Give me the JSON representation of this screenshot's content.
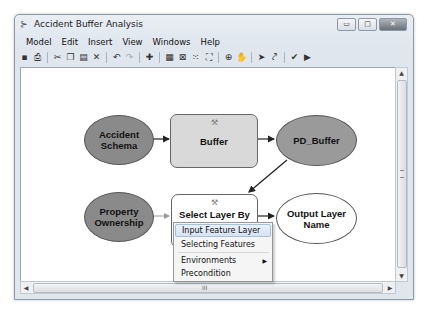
{
  "window": {
    "title": "Accident Buffer Analysis",
    "controls": {
      "minimize": "▭",
      "maximize": "□",
      "close": "✕"
    }
  },
  "menubar": {
    "items": [
      "Model",
      "Edit",
      "Insert",
      "View",
      "Windows",
      "Help"
    ]
  },
  "toolbar": {
    "buttons": [
      {
        "name": "save-icon",
        "glyph": "▪"
      },
      {
        "name": "print-icon",
        "glyph": "⎙"
      },
      {
        "name": "cut-icon",
        "glyph": "✂"
      },
      {
        "name": "copy-icon",
        "glyph": "❐"
      },
      {
        "name": "paste-icon",
        "glyph": "▤"
      },
      {
        "name": "delete-icon",
        "glyph": "✕"
      },
      {
        "name": "undo-icon",
        "glyph": "↶"
      },
      {
        "name": "redo-icon",
        "glyph": "↷"
      },
      {
        "name": "add-data-icon",
        "glyph": "✚"
      },
      {
        "name": "auto-layout-icon",
        "glyph": "▦"
      },
      {
        "name": "full-extent-icon",
        "glyph": "⊠"
      },
      {
        "name": "fixed-zoom-in-icon",
        "glyph": "⁙"
      },
      {
        "name": "fixed-zoom-out-icon",
        "glyph": "⛶"
      },
      {
        "name": "zoom-in-icon",
        "glyph": "⊕"
      },
      {
        "name": "pan-icon",
        "glyph": "✋"
      },
      {
        "name": "select-icon",
        "glyph": "➤"
      },
      {
        "name": "connect-icon",
        "glyph": "⤤"
      },
      {
        "name": "validate-icon",
        "glyph": "✔"
      },
      {
        "name": "run-icon",
        "glyph": "▶"
      }
    ]
  },
  "model": {
    "nodes": {
      "accident_schema": "Accident Schema",
      "buffer": "Buffer",
      "pd_buffer": "PD_Buffer",
      "property_ownership": "Property Ownership",
      "select_layer": "Select Layer By Location",
      "output_layer": "Output Layer Name"
    }
  },
  "context_menu": {
    "items": [
      {
        "label": "Input Feature Layer",
        "highlighted": true
      },
      {
        "label": "Selecting Features"
      },
      {
        "label": "Environments",
        "submenu": true
      },
      {
        "label": "Precondition"
      }
    ]
  },
  "scrollbars": {
    "up": "▲",
    "down": "▼",
    "left": "◀",
    "right": "▶",
    "hgrip": "III"
  },
  "colors": {
    "data_node": "#8a8a8a",
    "tool_node_gray": "#d9d9d9",
    "highlight": "#d5e3f2"
  }
}
